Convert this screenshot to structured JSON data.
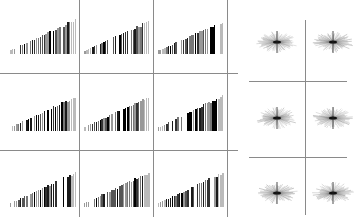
{
  "chart_data": [
    {
      "type": "bar",
      "title": "",
      "xlabel": "",
      "ylabel": "",
      "grid": true,
      "description": "3x3 grid of bar-code style ramp plots; bar heights increase linearly left to right, shades vary gray to black",
      "panels": [
        {
          "row": 0,
          "col": 0,
          "left": 10,
          "baseline": 54,
          "width": 67,
          "maxh": 36,
          "seed": 1
        },
        {
          "row": 0,
          "col": 1,
          "left": 84,
          "baseline": 54,
          "width": 66,
          "maxh": 34,
          "seed": 2
        },
        {
          "row": 0,
          "col": 2,
          "left": 158,
          "baseline": 54,
          "width": 66,
          "maxh": 34,
          "seed": 3
        },
        {
          "row": 1,
          "col": 0,
          "left": 10,
          "baseline": 131,
          "width": 67,
          "maxh": 36,
          "seed": 4
        },
        {
          "row": 1,
          "col": 1,
          "left": 84,
          "baseline": 131,
          "width": 66,
          "maxh": 36,
          "seed": 5
        },
        {
          "row": 1,
          "col": 2,
          "left": 158,
          "baseline": 131,
          "width": 66,
          "maxh": 37,
          "seed": 6
        },
        {
          "row": 2,
          "col": 0,
          "left": 10,
          "baseline": 207,
          "width": 67,
          "maxh": 36,
          "seed": 7
        },
        {
          "row": 2,
          "col": 1,
          "left": 84,
          "baseline": 207,
          "width": 66,
          "maxh": 36,
          "seed": 8
        },
        {
          "row": 2,
          "col": 2,
          "left": 158,
          "baseline": 207,
          "width": 66,
          "maxh": 36,
          "seed": 9
        }
      ],
      "bars_per_panel": 34,
      "shades": [
        "#1a1a1a",
        "#333333",
        "#555555",
        "#777777",
        "#999999",
        "#bbbbbb",
        "#000000"
      ]
    },
    {
      "type": "scatter",
      "title": "",
      "description": "3x2 grid of radial starburst patterns",
      "centers": [
        {
          "x": 277,
          "y": 42
        },
        {
          "x": 333,
          "y": 42
        },
        {
          "x": 277,
          "y": 118
        },
        {
          "x": 333,
          "y": 118
        },
        {
          "x": 277,
          "y": 193
        },
        {
          "x": 333,
          "y": 193
        }
      ],
      "radius_x": 21,
      "radius_y": 11,
      "rays": 60
    }
  ],
  "grid_lines": {
    "left_horizontal": [
      {
        "y": 73,
        "x1": 0,
        "x2": 238
      },
      {
        "y": 150,
        "x1": 0,
        "x2": 238
      }
    ],
    "left_vertical": [
      {
        "x": 79,
        "y1": 0,
        "y2": 217
      },
      {
        "x": 153,
        "y1": 0,
        "y2": 217
      },
      {
        "x": 227,
        "y1": 0,
        "y2": 217
      }
    ],
    "right_horizontal": [
      {
        "y": 81,
        "x1": 249,
        "x2": 347
      },
      {
        "y": 157,
        "x1": 249,
        "x2": 347
      }
    ],
    "right_vertical": [
      {
        "x": 305,
        "y1": 20,
        "y2": 215
      }
    ]
  }
}
